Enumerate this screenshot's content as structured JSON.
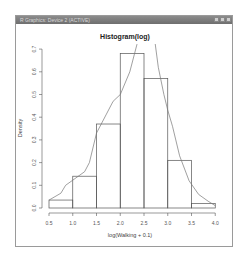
{
  "window": {
    "title": "R Graphics: Device 2 (ACTIVE)",
    "controls": [
      "minimize",
      "maximize",
      "close"
    ]
  },
  "chart_data": {
    "type": "bar",
    "title": "Histogram(log)",
    "xlabel": "log(Walking + 0.1)",
    "ylabel": "Density",
    "bins": [
      [
        0.5,
        1.0
      ],
      [
        1.0,
        1.5
      ],
      [
        1.5,
        2.0
      ],
      [
        2.0,
        2.5
      ],
      [
        2.5,
        3.0
      ],
      [
        3.0,
        3.5
      ],
      [
        3.5,
        4.0
      ]
    ],
    "categories": [
      "0.5-1.0",
      "1.0-1.5",
      "1.5-2.0",
      "2.0-2.5",
      "2.5-3.0",
      "3.0-3.5",
      "3.5-4.0"
    ],
    "values": [
      0.035,
      0.14,
      0.37,
      0.68,
      0.57,
      0.21,
      0.02
    ],
    "xticks": [
      "0.5",
      "1.0",
      "1.5",
      "2.0",
      "2.5",
      "3.0",
      "3.5",
      "4.0"
    ],
    "yticks": [
      "0.0",
      "0.1",
      "0.2",
      "0.3",
      "0.4",
      "0.5",
      "0.6",
      "0.7"
    ],
    "xlim": [
      0.5,
      4.0
    ],
    "ylim": [
      0,
      0.7
    ],
    "grid": false,
    "overlay": {
      "type": "density-line",
      "points": [
        [
          0.5,
          0.035
        ],
        [
          0.75,
          0.065
        ],
        [
          0.85,
          0.1
        ],
        [
          1.05,
          0.13
        ],
        [
          1.25,
          0.16
        ],
        [
          1.35,
          0.2
        ],
        [
          1.5,
          0.33
        ],
        [
          1.7,
          0.41
        ],
        [
          1.85,
          0.47
        ],
        [
          2.0,
          0.5
        ],
        [
          2.2,
          0.6
        ],
        [
          2.35,
          0.72
        ],
        [
          2.45,
          0.78
        ],
        [
          2.7,
          0.78
        ],
        [
          2.8,
          0.62
        ],
        [
          2.92,
          0.5
        ],
        [
          3.0,
          0.43
        ],
        [
          3.1,
          0.36
        ],
        [
          3.25,
          0.23
        ],
        [
          3.45,
          0.12
        ],
        [
          3.65,
          0.06
        ],
        [
          3.85,
          0.03
        ],
        [
          4.0,
          0.01
        ]
      ]
    }
  }
}
